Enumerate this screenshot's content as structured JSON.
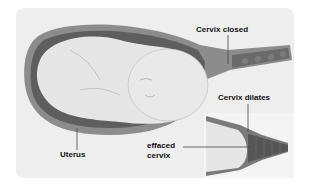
{
  "diagram": {
    "labels": {
      "cervix_closed": "Cervix closed",
      "cervix_dilates": "Cervix dilates",
      "effaced_cervix_line1": "effaced",
      "effaced_cervix_line2": "cervix",
      "uterus": "Uterus"
    },
    "colors": {
      "background_panel": "#eeeeee",
      "uterus_wall": "#8a8a8a",
      "uterus_outer": "#6e6e6e",
      "amniotic": "#c8c8c8",
      "baby": "#e4e4e4",
      "cervix": "#6a6a6a",
      "inset_bg": "#f4f4f4"
    }
  }
}
